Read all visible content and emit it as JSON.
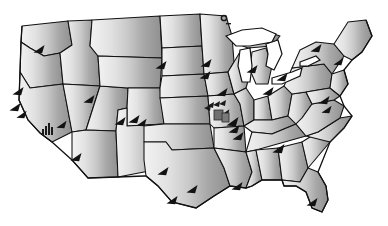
{
  "map": {
    "title": "United States map",
    "description": "Grayscale choropleth map of the contiguous United States with a west-to-east lightness gradient and black triangular point markers.",
    "background_color": "#ffffff",
    "border_color": "#111111",
    "marker_color": "#121212",
    "lake_fill": "#ffffff",
    "gradient": {
      "direction": "west-to-east",
      "west_color": "#efefef",
      "mid_color": "#c6c6c6",
      "east_color": "#929292"
    },
    "lakes": [
      {
        "name": "lake-superior"
      },
      {
        "name": "lake-michigan"
      },
      {
        "name": "lake-huron"
      },
      {
        "name": "lake-erie"
      },
      {
        "name": "lake-ontario"
      }
    ],
    "markers": [
      {
        "name": "marker-washington",
        "x": 38,
        "y": 47,
        "size": 11
      },
      {
        "name": "marker-oregon",
        "x": 17,
        "y": 88,
        "size": 11
      },
      {
        "name": "marker-california-north",
        "x": 14,
        "y": 96,
        "size": 10
      },
      {
        "name": "marker-california-central",
        "x": 22,
        "y": 111
      },
      {
        "name": "marker-nevada",
        "x": 61,
        "y": 121,
        "size": 10
      },
      {
        "name": "marker-california-south",
        "x": 76,
        "y": 155,
        "size": 11
      },
      {
        "name": "marker-idaho",
        "x": 88,
        "y": 96,
        "size": 11
      },
      {
        "name": "marker-arizona",
        "x": 120,
        "y": 118,
        "size": 11
      },
      {
        "name": "marker-wyoming",
        "x": 88,
        "y": 99,
        "size": 10
      },
      {
        "name": "marker-colorado",
        "x": 133,
        "y": 116,
        "size": 11
      },
      {
        "name": "marker-newmexico",
        "x": 139,
        "y": 119,
        "size": 10
      },
      {
        "name": "marker-texas-north",
        "x": 163,
        "y": 168,
        "size": 11
      },
      {
        "name": "marker-texas-central",
        "x": 192,
        "y": 186,
        "size": 11
      },
      {
        "name": "marker-texas-south",
        "x": 172,
        "y": 197,
        "size": 11
      },
      {
        "name": "marker-nebraska",
        "x": 160,
        "y": 62,
        "size": 11
      },
      {
        "name": "marker-kansas",
        "x": 205,
        "y": 60,
        "size": 11
      },
      {
        "name": "marker-minnesota",
        "x": 204,
        "y": 71,
        "size": 11
      },
      {
        "name": "marker-missouri-cluster",
        "x": 222,
        "y": 112,
        "size": 13
      },
      {
        "name": "marker-illinois",
        "x": 232,
        "y": 118,
        "size": 12
      },
      {
        "name": "marker-kentucky",
        "x": 234,
        "y": 126,
        "size": 11
      },
      {
        "name": "marker-tennessee",
        "x": 238,
        "y": 133,
        "size": 11
      },
      {
        "name": "marker-louisiana",
        "x": 237,
        "y": 183,
        "size": 11
      },
      {
        "name": "marker-georgia",
        "x": 279,
        "y": 146,
        "size": 12
      },
      {
        "name": "marker-florida",
        "x": 312,
        "y": 199,
        "size": 11
      },
      {
        "name": "marker-ohio",
        "x": 268,
        "y": 88,
        "size": 11
      },
      {
        "name": "marker-pennsylvania",
        "x": 282,
        "y": 74,
        "size": 11
      },
      {
        "name": "marker-newyork",
        "x": 316,
        "y": 45,
        "size": 11
      },
      {
        "name": "marker-newengland",
        "x": 338,
        "y": 58,
        "size": 10
      },
      {
        "name": "marker-virginia",
        "x": 324,
        "y": 97,
        "size": 11
      },
      {
        "name": "marker-northcarolina",
        "x": 326,
        "y": 107,
        "size": 10
      },
      {
        "name": "marker-michigan-upper",
        "x": 252,
        "y": 66,
        "size": 11
      },
      {
        "name": "marker-wisconsin",
        "x": 221,
        "y": 86,
        "size": 11
      }
    ],
    "glyphs": [
      {
        "name": "bar-chart-glyph-southwest",
        "x": 44,
        "y": 124
      },
      {
        "name": "ring-glyph-michigan",
        "x": 224,
        "y": 18
      },
      {
        "name": "cluster-glyph-missouri",
        "x": 214,
        "y": 104
      }
    ]
  }
}
